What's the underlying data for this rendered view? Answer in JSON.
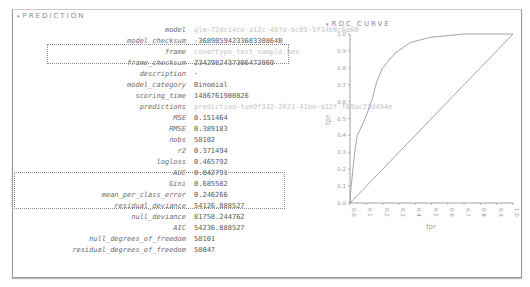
{
  "prediction": {
    "title": "PREDICTION",
    "caret": "▾",
    "rows": [
      {
        "key": "model",
        "value": "glm-72dc14ce-a12c-4bfd-bc85-5f34b8c6a60",
        "faded": true
      },
      {
        "key": "model_checksum",
        "value": "-3689059423368330864B",
        "faded": false
      },
      {
        "key": "frame",
        "value": "covertype_test_sample.hex",
        "faded": true
      },
      {
        "key": "frame_checksum",
        "value": "2342982437306472069",
        "faded": false
      },
      {
        "key": "description",
        "value": "·",
        "faded": false
      },
      {
        "key": "model_category",
        "value": "Binomial",
        "faded": false
      },
      {
        "key": "scoring_time",
        "value": "1486761900826",
        "faded": false
      },
      {
        "key": "predictions",
        "value": "prediction-tum9f322-2621-41be-a12f-f69ac23d494e",
        "faded": true
      },
      {
        "key": "MSE",
        "value": "0.151464",
        "faded": false
      },
      {
        "key": "RMSE",
        "value": "0.389183",
        "faded": false
      },
      {
        "key": "nobs",
        "value": "58102",
        "faded": false
      },
      {
        "key": "r2",
        "value": "0.371494",
        "faded": false
      },
      {
        "key": "logloss",
        "value": "0.465792",
        "faded": false
      },
      {
        "key": "AUC",
        "value": "0.842791",
        "faded": false
      },
      {
        "key": "Gini",
        "value": "0.685582",
        "faded": false
      },
      {
        "key": "mean_per_class_error",
        "value": "0.246266",
        "faded": false
      },
      {
        "key": "residual_deviance",
        "value": "54126.888527",
        "faded": false
      },
      {
        "key": "null_deviance",
        "value": "81758.244762",
        "faded": false
      },
      {
        "key": "AIC",
        "value": "54236.888527",
        "faded": false
      },
      {
        "key": "null_degrees_of_freedom",
        "value": "58101",
        "faded": false
      },
      {
        "key": "residual_degrees_of_freedom",
        "value": "58047",
        "faded": false
      }
    ]
  },
  "roc": {
    "title": "ROC CURVE",
    "caret": "▾"
  },
  "chart_data": {
    "type": "line",
    "title": "ROC CURVE",
    "xlabel": "fpr",
    "ylabel": "tpr",
    "xlim": [
      0,
      1
    ],
    "ylim": [
      0,
      1
    ],
    "x_ticks": [
      "0.0",
      "0.1",
      "0.2",
      "0.3",
      "0.4",
      "0.5",
      "0.6",
      "0.7",
      "0.8",
      "0.9",
      "1.0"
    ],
    "y_ticks": [
      "0.0",
      "0.1",
      "0.2",
      "0.3",
      "0.4",
      "0.5",
      "0.6",
      "0.7",
      "0.8",
      "0.9",
      "1.0"
    ],
    "grid": false,
    "series": [
      {
        "name": "roc",
        "x": [
          0,
          0.005,
          0.03,
          0.045,
          0.075,
          0.105,
          0.135,
          0.165,
          0.2,
          0.28,
          0.37,
          0.49,
          0.7,
          1.0
        ],
        "y": [
          0,
          0.08,
          0.31,
          0.4,
          0.46,
          0.53,
          0.61,
          0.72,
          0.8,
          0.89,
          0.95,
          0.98,
          1.0,
          1.0
        ]
      },
      {
        "name": "diagonal",
        "x": [
          0,
          1
        ],
        "y": [
          0,
          1
        ]
      }
    ],
    "colors": {
      "line": "#9a9a9a",
      "axis": "#8a8a8a"
    }
  }
}
